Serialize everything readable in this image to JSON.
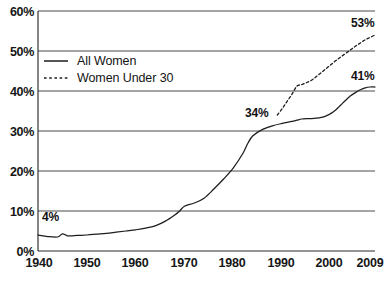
{
  "chart_data": {
    "type": "line",
    "title": "",
    "xlabel": "",
    "ylabel": "",
    "xlim": [
      1940,
      2009
    ],
    "ylim": [
      0,
      60
    ],
    "grid": "horizontal",
    "legend_position": "upper-left-inside",
    "x_ticks": [
      "1940",
      "1950",
      "1960",
      "1970",
      "1980",
      "1990",
      "2000",
      "2009"
    ],
    "x_tick_values": [
      1940,
      1950,
      1960,
      1970,
      1980,
      1990,
      2000,
      2009
    ],
    "y_ticks": [
      "0%",
      "10%",
      "20%",
      "30%",
      "40%",
      "50%",
      "60%"
    ],
    "y_tick_values": [
      0,
      10,
      20,
      30,
      40,
      50,
      60
    ],
    "series": [
      {
        "name": "All Women",
        "style": "solid",
        "color": "#1d1d1d",
        "x": [
          1940,
          1942,
          1944,
          1945,
          1946,
          1947,
          1948,
          1950,
          1952,
          1954,
          1956,
          1958,
          1960,
          1962,
          1964,
          1966,
          1968,
          1969,
          1970,
          1972,
          1974,
          1976,
          1978,
          1980,
          1982,
          1983,
          1984,
          1986,
          1988,
          1990,
          1992,
          1993,
          1994,
          1995,
          1996,
          1997,
          1998,
          1999,
          2000,
          2001,
          2002,
          2003,
          2004,
          2005,
          2006,
          2007,
          2008,
          2009
        ],
        "values": [
          4.0,
          3.6,
          3.5,
          4.3,
          3.8,
          3.8,
          3.9,
          4.0,
          4.2,
          4.4,
          4.7,
          5.0,
          5.3,
          5.7,
          6.3,
          7.4,
          9.0,
          10.0,
          11.2,
          12.0,
          13.2,
          15.5,
          18.0,
          20.8,
          24.5,
          27.0,
          28.8,
          30.4,
          31.3,
          31.9,
          32.4,
          32.7,
          33.0,
          33.1,
          33.1,
          33.2,
          33.4,
          33.8,
          34.4,
          35.3,
          36.5,
          37.7,
          38.8,
          39.6,
          40.3,
          40.8,
          41.0,
          41.0
        ]
      },
      {
        "name": "Women Under 30",
        "style": "dotted",
        "color": "#1d1d1d",
        "x": [
          1989,
          1990,
          1991,
          1992,
          1993,
          1994,
          1995,
          1996,
          1997,
          1998,
          1999,
          2000,
          2001,
          2002,
          2003,
          2004,
          2005,
          2006,
          2007,
          2008,
          2009
        ],
        "values": [
          34.0,
          35.6,
          37.4,
          39.2,
          41.2,
          41.6,
          42.1,
          42.7,
          43.6,
          44.6,
          45.6,
          46.6,
          47.6,
          48.5,
          49.4,
          50.3,
          51.2,
          52.0,
          52.8,
          53.4,
          54.0
        ]
      }
    ],
    "annotations": [
      {
        "text": "4%",
        "x": 1941,
        "y": 4.0,
        "series": "All Women"
      },
      {
        "text": "34%",
        "x": 1989,
        "y": 34.0,
        "series": "Women Under 30"
      },
      {
        "text": "41%",
        "x": 2009,
        "y": 41.0,
        "series": "All Women"
      },
      {
        "text": "53%",
        "x": 2009,
        "y": 54.0,
        "series": "Women Under 30"
      }
    ]
  },
  "legend": {
    "items": [
      {
        "label": "All Women",
        "style": "solid"
      },
      {
        "label": "Women Under 30",
        "style": "dotted"
      }
    ]
  },
  "labels": {
    "y0": "0%",
    "y10": "10%",
    "y20": "20%",
    "y30": "30%",
    "y40": "40%",
    "y50": "50%",
    "y60": "60%",
    "x1940": "1940",
    "x1950": "1950",
    "x1960": "1960",
    "x1970": "1970",
    "x1980": "1980",
    "x1990": "1990",
    "x2000": "2000",
    "x2009": "2009",
    "p4": "4%",
    "p34": "34%",
    "p41": "41%",
    "p53": "53%"
  },
  "colors": {
    "line": "#1d1d1d",
    "grid": "#4a4a4a",
    "axis": "#2b2b2b",
    "background": "#ffffff"
  }
}
